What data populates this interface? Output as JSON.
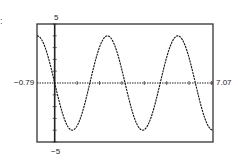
{
  "corner_mark": ":",
  "chart_data": {
    "type": "line",
    "title": "",
    "xlabel": "",
    "ylabel": "",
    "function": "y = -4 sin(2x)",
    "window": {
      "xmin": -0.79,
      "xmax": 7.07,
      "ymin": -5,
      "ymax": 5
    },
    "xlim": [
      -0.79,
      7.07
    ],
    "ylim": [
      -5,
      5
    ],
    "tick_labels": {
      "xmin": "−0.79",
      "xmax": "7.07",
      "ymax": "5",
      "ymin": "−5"
    },
    "grid": false,
    "legend": null,
    "series": [
      {
        "name": "y1",
        "x": [
          -0.79,
          0,
          0.79,
          1.57,
          2.36,
          3.14,
          3.93,
          4.71,
          5.5,
          6.28,
          7.07
        ],
        "y": [
          4,
          0,
          -4,
          0,
          4,
          0,
          -4,
          0,
          4,
          0,
          -4
        ]
      }
    ],
    "frame": {
      "left": 37,
      "top": 24,
      "right": 213,
      "bottom": 142
    },
    "colors": {
      "curve": "#111111",
      "axes": "#222222",
      "frame": "#333333"
    }
  }
}
